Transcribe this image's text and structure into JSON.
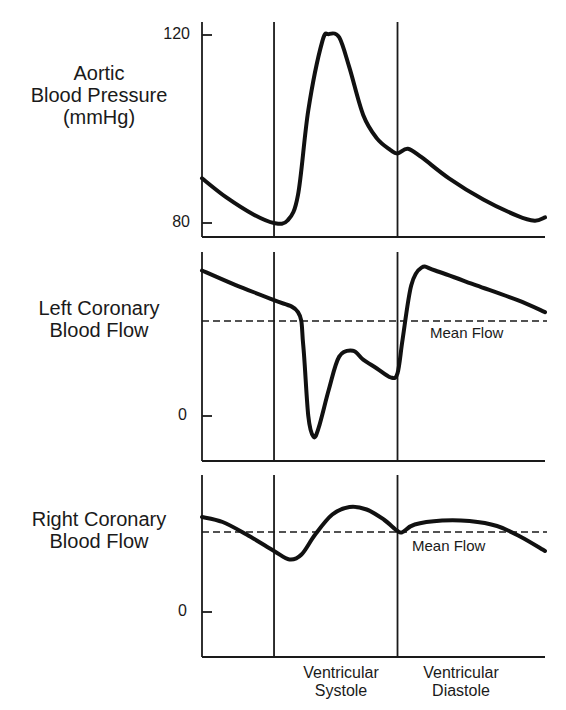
{
  "chart_data": [
    {
      "type": "line",
      "title": "Aortic Blood Pressure (mmHg)",
      "ylabel": "Aortic Blood Pressure (mmHg)",
      "ylabel_lines": [
        "Aortic",
        "Blood Pressure",
        "(mmHg)"
      ],
      "yticks": [
        80,
        120
      ],
      "ylim": [
        77,
        123
      ],
      "x_units": "normalized cardiac cycle (0–1)",
      "phase_boundaries": [
        0.21,
        0.57
      ],
      "series": [
        {
          "name": "Aortic pressure",
          "x": [
            0.0,
            0.07,
            0.15,
            0.21,
            0.25,
            0.28,
            0.31,
            0.35,
            0.37,
            0.4,
            0.43,
            0.47,
            0.51,
            0.55,
            0.57,
            0.6,
            0.64,
            0.72,
            0.82,
            0.92,
            0.97,
            1.0
          ],
          "y": [
            89.5,
            85.5,
            81.8,
            80.0,
            80.6,
            86,
            104,
            118.5,
            120.2,
            119.5,
            113,
            103,
            98,
            95.5,
            94.8,
            95.8,
            94,
            89.5,
            85,
            81.5,
            80.5,
            81.2
          ]
        }
      ]
    },
    {
      "type": "line",
      "title": "Left Coronary Blood Flow",
      "ylabel": "Left Coronary Blood Flow",
      "ylabel_lines": [
        "Left Coronary",
        "Blood Flow"
      ],
      "yticks": [
        0
      ],
      "ylim": [
        -0.45,
        2.8
      ],
      "mean_flow": 1.6,
      "mean_label": "Mean Flow",
      "phase_boundaries": [
        0.21,
        0.57
      ],
      "series": [
        {
          "name": "Left coronary flow",
          "x": [
            0.0,
            0.1,
            0.21,
            0.28,
            0.295,
            0.31,
            0.325,
            0.34,
            0.37,
            0.4,
            0.44,
            0.47,
            0.51,
            0.55,
            0.57,
            0.585,
            0.61,
            0.64,
            0.68,
            0.8,
            0.92,
            1.0
          ],
          "y": [
            2.45,
            2.2,
            1.95,
            1.75,
            1.2,
            0.0,
            -0.35,
            -0.2,
            0.45,
            1.0,
            1.1,
            0.95,
            0.8,
            0.65,
            0.72,
            1.3,
            2.2,
            2.5,
            2.45,
            2.2,
            1.95,
            1.75
          ]
        }
      ]
    },
    {
      "type": "line",
      "title": "Right Coronary Blood Flow",
      "ylabel": "Right Coronary Blood Flow",
      "ylabel_lines": [
        "Right Coronary",
        "Blood Flow"
      ],
      "yticks": [
        0
      ],
      "ylim": [
        -0.8,
        2.3
      ],
      "mean_flow": 1.6,
      "mean_label": "Mean Flow",
      "phase_boundaries": [
        0.21,
        0.57
      ],
      "xlabels": [
        {
          "x": 0.39,
          "lines": [
            "Ventricular",
            "Systole"
          ]
        },
        {
          "x": 0.745,
          "lines": [
            "Ventricular",
            "Diastole"
          ]
        }
      ],
      "series": [
        {
          "name": "Right coronary flow",
          "x": [
            0.0,
            0.06,
            0.13,
            0.21,
            0.255,
            0.29,
            0.33,
            0.38,
            0.43,
            0.48,
            0.53,
            0.57,
            0.585,
            0.62,
            0.7,
            0.78,
            0.86,
            0.93,
            1.0
          ],
          "y": [
            1.9,
            1.8,
            1.55,
            1.22,
            1.05,
            1.15,
            1.55,
            1.95,
            2.1,
            2.05,
            1.85,
            1.62,
            1.6,
            1.75,
            1.83,
            1.82,
            1.72,
            1.5,
            1.22
          ]
        }
      ]
    }
  ],
  "panels": [
    {
      "label_lines": [
        "Aortic",
        "Blood Pressure",
        "(mmHg)"
      ],
      "ticks": [
        "120",
        "80"
      ]
    },
    {
      "label_lines": [
        "Left Coronary",
        "Blood Flow"
      ],
      "ticks": [
        "0"
      ],
      "mean_label": "Mean Flow"
    },
    {
      "label_lines": [
        "Right Coronary",
        "Blood Flow"
      ],
      "ticks": [
        "0"
      ],
      "mean_label": "Mean Flow"
    }
  ],
  "phases": {
    "systole": [
      "Ventricular",
      "Systole"
    ],
    "diastole": [
      "Ventricular",
      "Diastole"
    ]
  }
}
